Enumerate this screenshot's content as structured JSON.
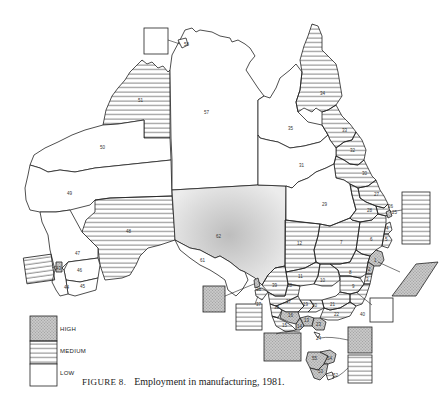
{
  "figure": {
    "number_label": "FIGURE 8.",
    "title": "Employment in manufacturing, 1981."
  },
  "legend": {
    "items": [
      {
        "key": "high",
        "label": "HIGH",
        "pattern": "stipple",
        "color": "#b5b5b5"
      },
      {
        "key": "medium",
        "label": "MEDIUM",
        "pattern": "horizontal-lines",
        "color": "#333333"
      },
      {
        "key": "low",
        "label": "LOW",
        "pattern": "blank",
        "color": "#ffffff"
      }
    ]
  },
  "regions": [
    {
      "id": "1",
      "class": "high"
    },
    {
      "id": "2",
      "class": "high"
    },
    {
      "id": "3",
      "class": "medium"
    },
    {
      "id": "4",
      "class": "medium"
    },
    {
      "id": "5",
      "class": "medium"
    },
    {
      "id": "6",
      "class": "medium"
    },
    {
      "id": "7",
      "class": "medium"
    },
    {
      "id": "8",
      "class": "medium"
    },
    {
      "id": "9",
      "class": "medium"
    },
    {
      "id": "10",
      "class": "medium"
    },
    {
      "id": "11",
      "class": "medium"
    },
    {
      "id": "12",
      "class": "medium"
    },
    {
      "id": "13",
      "class": "high"
    },
    {
      "id": "14",
      "class": "high"
    },
    {
      "id": "15",
      "class": "medium"
    },
    {
      "id": "16",
      "class": "medium"
    },
    {
      "id": "17",
      "class": "medium"
    },
    {
      "id": "18",
      "class": "medium"
    },
    {
      "id": "19",
      "class": "low"
    },
    {
      "id": "20",
      "class": "medium"
    },
    {
      "id": "21",
      "class": "medium"
    },
    {
      "id": "22",
      "class": "medium"
    },
    {
      "id": "23",
      "class": "high"
    },
    {
      "id": "24",
      "class": "low"
    },
    {
      "id": "25",
      "class": "medium"
    },
    {
      "id": "26",
      "class": "medium"
    },
    {
      "id": "27",
      "class": "medium"
    },
    {
      "id": "28",
      "class": "medium"
    },
    {
      "id": "29",
      "class": "low"
    },
    {
      "id": "30",
      "class": "medium"
    },
    {
      "id": "31",
      "class": "low"
    },
    {
      "id": "32",
      "class": "medium"
    },
    {
      "id": "33",
      "class": "medium"
    },
    {
      "id": "34",
      "class": "medium"
    },
    {
      "id": "35",
      "class": "low"
    },
    {
      "id": "36",
      "class": "high"
    },
    {
      "id": "37",
      "class": "medium"
    },
    {
      "id": "38",
      "class": "high"
    },
    {
      "id": "39",
      "class": "medium"
    },
    {
      "id": "40",
      "class": "medium"
    },
    {
      "id": "41",
      "class": "low"
    },
    {
      "id": "42",
      "class": "high"
    },
    {
      "id": "43",
      "class": "high"
    },
    {
      "id": "44",
      "class": "low"
    },
    {
      "id": "45",
      "class": "low"
    },
    {
      "id": "46",
      "class": "low"
    },
    {
      "id": "47",
      "class": "low"
    },
    {
      "id": "48",
      "class": "medium"
    },
    {
      "id": "49",
      "class": "low"
    },
    {
      "id": "50",
      "class": "low"
    },
    {
      "id": "51",
      "class": "medium"
    },
    {
      "id": "52",
      "class": "medium"
    },
    {
      "id": "53",
      "class": "high"
    },
    {
      "id": "54",
      "class": "high"
    },
    {
      "id": "55",
      "class": "high"
    },
    {
      "id": "57",
      "class": "low"
    },
    {
      "id": "58",
      "class": "low"
    },
    {
      "id": "61",
      "class": "low"
    },
    {
      "id": "62",
      "class": "high"
    }
  ],
  "labels": {
    "l51": "51",
    "l50": "50",
    "l49": "49",
    "l48": "48",
    "l47": "47",
    "l46": "46",
    "l45": "45",
    "l44": "44",
    "l43": "43",
    "l57": "57",
    "l58": "58",
    "l62": "62",
    "l61": "61",
    "l35": "35",
    "l31": "31",
    "l29": "29",
    "l34": "34",
    "l33": "33",
    "l32": "32",
    "l30": "30",
    "l27": "27",
    "l28": "28",
    "l26": "26",
    "l25": "25",
    "l12": "12",
    "l7": "7",
    "l6": "6",
    "l5": "5",
    "l4": "4",
    "l1": "1",
    "l2": "2",
    "l3": "3",
    "l11": "11",
    "l10": "10",
    "l8": "8",
    "l9": "9",
    "l39": "39",
    "l18": "18",
    "l37": "37",
    "l38": "38",
    "l17": "17",
    "l19": "19",
    "l20": "20",
    "l21": "21",
    "l40": "40",
    "l16": "16",
    "l15": "15",
    "l13": "13",
    "l14": "14",
    "l23": "23",
    "l22": "22",
    "l36": "36",
    "l24": "24",
    "l55": "55",
    "l54": "54",
    "l53": "53",
    "l52": "52"
  }
}
